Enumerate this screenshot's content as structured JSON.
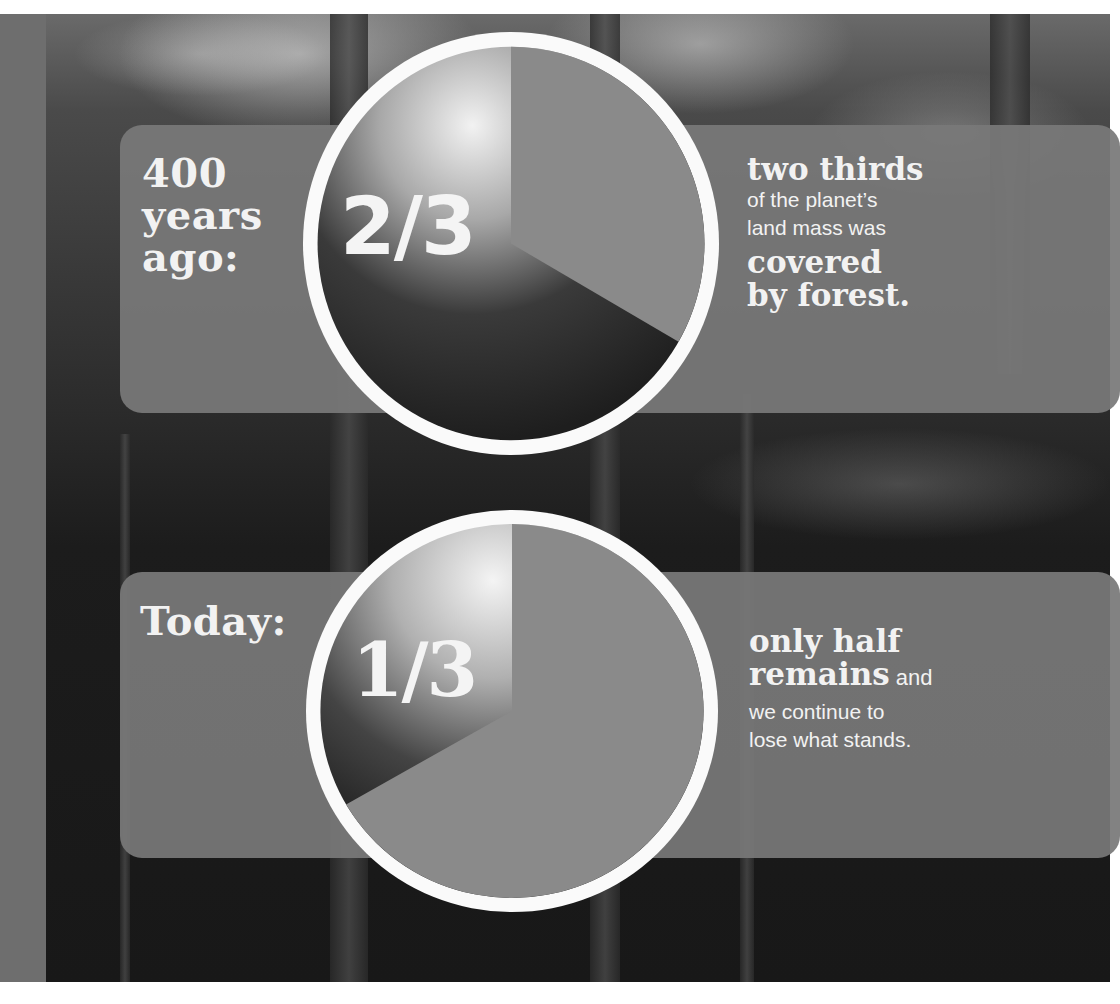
{
  "colors": {
    "panel": "#787878",
    "ring": "#fafafa",
    "wedge": "#8a8a8a",
    "text": "#f2f2f2",
    "left_strip": "#6e6e6e"
  },
  "section_past": {
    "lead": [
      "400",
      "years",
      "ago:"
    ],
    "fraction": "2/3",
    "caption": {
      "bold_top": "two thirds",
      "regular_lines": [
        "of the planet’s",
        "land mass was"
      ],
      "bold_bottom": [
        "covered",
        "by forest."
      ]
    },
    "pie": {
      "forest_share": 0.6667,
      "gray_share": 0.3333
    }
  },
  "section_today": {
    "lead": "Today:",
    "fraction": "1/3",
    "caption": {
      "bold_line_1": "only half",
      "bold_line_2": "remains",
      "inline_regular": " and",
      "regular_lines": [
        "we continue to",
        "lose what stands."
      ]
    },
    "pie": {
      "forest_share": 0.3333,
      "gray_share": 0.6667
    }
  }
}
